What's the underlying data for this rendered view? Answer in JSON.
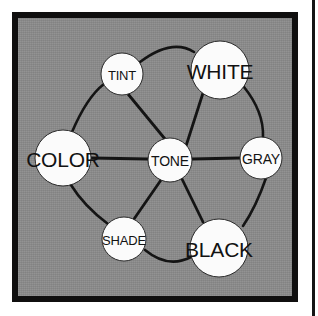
{
  "figure": {
    "type": "node-link-diagram",
    "background_color": "#8b8b8b",
    "frame_color": "#100f0f",
    "node_fill": "#fbfbfb",
    "node_text_color": "#121212",
    "edge_color": "#141414"
  },
  "nodes": [
    {
      "id": "tint",
      "label": "TINT",
      "cx": 122,
      "cy": 74,
      "r": 21,
      "font_size": 13
    },
    {
      "id": "white",
      "label": "WHITE",
      "cx": 220,
      "cy": 70,
      "r": 29,
      "font_size": 21
    },
    {
      "id": "color",
      "label": "COLOR",
      "cx": 63,
      "cy": 158,
      "r": 28,
      "font_size": 21
    },
    {
      "id": "tone",
      "label": "TONE",
      "cx": 170,
      "cy": 160,
      "r": 22,
      "font_size": 14
    },
    {
      "id": "gray",
      "label": "GRAY",
      "cx": 261,
      "cy": 158,
      "r": 21,
      "font_size": 14
    },
    {
      "id": "shade",
      "label": "SHADE",
      "cx": 124,
      "cy": 239,
      "r": 22,
      "font_size": 13
    },
    {
      "id": "black",
      "label": "BLACK",
      "cx": 219,
      "cy": 248,
      "r": 29,
      "font_size": 21
    }
  ],
  "edges": [
    {
      "from": "tone",
      "to": "tint",
      "kind": "spoke"
    },
    {
      "from": "tone",
      "to": "white",
      "kind": "spoke"
    },
    {
      "from": "tone",
      "to": "color",
      "kind": "spoke"
    },
    {
      "from": "tone",
      "to": "gray",
      "kind": "spoke"
    },
    {
      "from": "tone",
      "to": "shade",
      "kind": "spoke"
    },
    {
      "from": "tone",
      "to": "black",
      "kind": "spoke"
    },
    {
      "from": "tint",
      "to": "white",
      "kind": "rim"
    },
    {
      "from": "white",
      "to": "gray",
      "kind": "rim"
    },
    {
      "from": "gray",
      "to": "black",
      "kind": "rim"
    },
    {
      "from": "black",
      "to": "shade",
      "kind": "rim"
    },
    {
      "from": "shade",
      "to": "color",
      "kind": "rim"
    },
    {
      "from": "color",
      "to": "tint",
      "kind": "rim"
    }
  ],
  "labels": {
    "tint": "TINT",
    "white": "WHITE",
    "color": "COLOR",
    "tone": "TONE",
    "gray": "GRAY",
    "shade": "SHADE",
    "black": "BLACK"
  }
}
